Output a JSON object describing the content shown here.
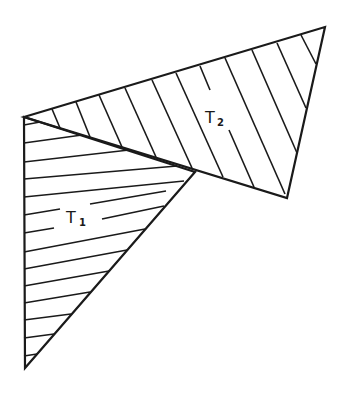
{
  "figure": {
    "type": "two overlapping hatched triangles",
    "stroke_color": "#1a1a1a",
    "background": "#ffffff",
    "triangles": [
      {
        "id": "T1",
        "label_main": "T",
        "label_sub": "1",
        "vertices": [
          [
            24,
            117
          ],
          [
            195,
            172
          ],
          [
            25,
            368
          ]
        ],
        "hatch": "near-horizontal lines rising slightly to the right"
      },
      {
        "id": "T2",
        "label_main": "T",
        "label_sub": "2",
        "vertices": [
          [
            24,
            117
          ],
          [
            325,
            27
          ],
          [
            287,
            198
          ]
        ],
        "hatch": "diagonal lines descending to the right"
      }
    ]
  }
}
